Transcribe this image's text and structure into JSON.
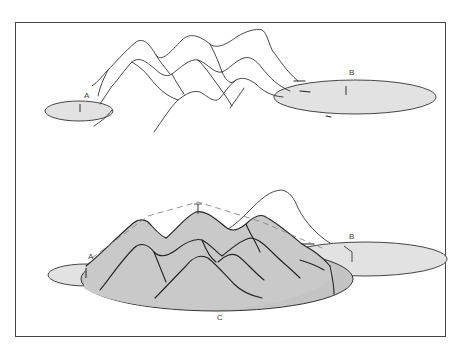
{
  "figure": {
    "top_panel": {
      "labels": {
        "a": "A",
        "b": "B"
      }
    },
    "bottom_panel": {
      "labels": {
        "a": "A",
        "b": "B",
        "c": "C"
      }
    },
    "colors": {
      "frame": "#444444",
      "ellipse_fill_light": "#e2e2e2",
      "mountain_fill": "#c9c9c9",
      "ellipse_c_fill": "#c4c4c4",
      "line": "#333333",
      "dashed": "#888888"
    }
  }
}
